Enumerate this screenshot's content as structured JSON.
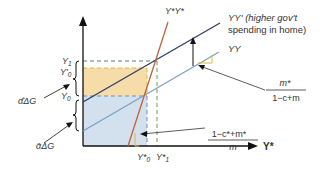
{
  "diagram": {
    "x_axis_label": "Y*",
    "curves": {
      "yy_prime": {
        "label": "YY' (higher gov't",
        "label_line2": "spending in home)",
        "color": "#2e3d66"
      },
      "yy": {
        "label": "YY",
        "color": "#7f9fc4"
      },
      "ystar": {
        "label": "Y*Y*",
        "color": "#c0633a"
      }
    },
    "y_axis_labels": {
      "y1": "Y",
      "y1_sub": "1",
      "y0p": "Y'",
      "y0p_sub": "0",
      "y0": "Y",
      "y0_sub": "0"
    },
    "x_axis_ticks": {
      "ys0": "Y*",
      "ys0_sub": "0",
      "ys1": "Y*",
      "ys1_sub": "1"
    },
    "annotations": {
      "alpha_hat": "α̂ΔG",
      "alpha_bar": "ᾱΔG",
      "slope_yy_num": "m*",
      "slope_yy_den": "1−c+m",
      "slope_ystar_num": "1−c*+m*",
      "slope_ystar_den": "m"
    },
    "colors": {
      "orange_fill": "#f6dca8",
      "blue_fill": "#d3e0ee",
      "dash_green": "#6b9a4e",
      "dash_blue": "#6a8fc0",
      "axis": "#111111"
    }
  }
}
